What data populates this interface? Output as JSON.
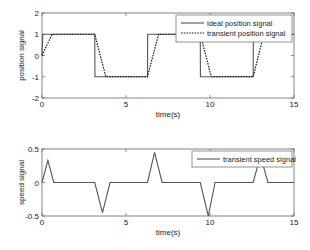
{
  "chart_data": [
    {
      "type": "line",
      "ylabel": "position signal",
      "xlabel": "time(s)",
      "xlim": [
        0,
        15
      ],
      "ylim": [
        -2,
        2
      ],
      "xticks": [
        0,
        5,
        10,
        15
      ],
      "yticks": [
        -2,
        -1,
        0,
        1,
        2
      ],
      "grid": false,
      "legend_position": "upper right",
      "series": [
        {
          "name": "ideal position signal",
          "style": "solid",
          "x": [
            0,
            0.05,
            3.14,
            3.15,
            6.28,
            6.29,
            9.42,
            9.43,
            12.57,
            12.58,
            15
          ],
          "y": [
            0,
            1,
            1,
            -1,
            -1,
            1,
            1,
            -1,
            -1,
            1,
            1
          ]
        },
        {
          "name": "transient position signal",
          "style": "dotted",
          "x": [
            0,
            0.6,
            3.14,
            3.8,
            6.28,
            6.94,
            9.42,
            10.08,
            12.57,
            13.2,
            15
          ],
          "y": [
            0,
            1,
            1,
            -1,
            -1,
            1,
            1,
            -1,
            -1,
            1,
            1
          ]
        }
      ]
    },
    {
      "type": "line",
      "ylabel": "speed signal",
      "xlabel": "time(s)",
      "xlim": [
        0,
        15
      ],
      "ylim": [
        -0.5,
        0.5
      ],
      "xticks": [
        0,
        5,
        10,
        15
      ],
      "yticks": [
        -0.5,
        0,
        0.5
      ],
      "grid": false,
      "legend_position": "upper right",
      "series": [
        {
          "name": "transient speed signal",
          "style": "solid",
          "x": [
            0,
            0.35,
            0.7,
            3.14,
            3.6,
            4.05,
            6.28,
            6.7,
            7.15,
            9.42,
            9.9,
            10.3,
            12.57,
            13.0,
            13.45,
            15
          ],
          "y": [
            0,
            0.33,
            0,
            0,
            -0.45,
            0,
            0,
            0.45,
            0,
            0,
            -0.5,
            0,
            0,
            0.4,
            0,
            0
          ]
        }
      ]
    }
  ]
}
